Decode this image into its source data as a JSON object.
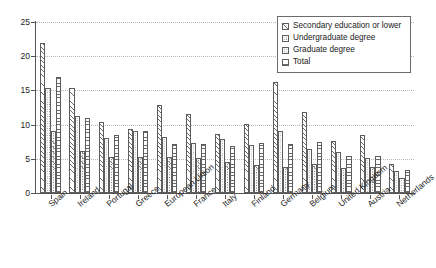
{
  "chart_data": {
    "type": "bar",
    "title": "",
    "subtitle": "",
    "xlabel": "",
    "ylabel": "",
    "ylim": [
      0,
      25
    ],
    "yticks": [
      0,
      5,
      10,
      15,
      20,
      25
    ],
    "grid": true,
    "legend_position": "upper-right",
    "categories": [
      "Spain",
      "Ireland",
      "Portugal",
      "Greece",
      "European Union",
      "France",
      "Italy",
      "Finland",
      "Germany",
      "Belgium",
      "United Kingdom",
      "Austria",
      "Netherlands"
    ],
    "series": [
      {
        "name": "Secondary education or lower",
        "pattern": "diagonal-hatch",
        "values": [
          22.0,
          15.3,
          10.4,
          9.3,
          12.9,
          11.6,
          8.6,
          10.1,
          16.3,
          11.8,
          7.6,
          8.5,
          4.3
        ]
      },
      {
        "name": "Undergraduate degree",
        "pattern": "dotted-hatch",
        "values": [
          15.3,
          11.3,
          8.0,
          9.0,
          8.2,
          7.3,
          7.9,
          7.0,
          9.0,
          6.5,
          6.0,
          5.1,
          3.2
        ]
      },
      {
        "name": "Graduate degree",
        "pattern": "fine-dot-hatch",
        "values": [
          9.1,
          6.2,
          5.3,
          5.3,
          5.3,
          5.1,
          4.6,
          4.1,
          3.8,
          4.2,
          3.7,
          3.8,
          2.2
        ]
      },
      {
        "name": "Total",
        "pattern": "horizontal-hatch",
        "values": [
          17.0,
          11.0,
          8.5,
          9.0,
          7.2,
          7.2,
          6.9,
          7.3,
          7.2,
          7.5,
          5.4,
          5.4,
          3.3
        ]
      }
    ]
  },
  "legend": {
    "items": [
      {
        "label": "Secondary education or lower"
      },
      {
        "label": "Undergraduate degree"
      },
      {
        "label": "Graduate degree"
      },
      {
        "label": "Total"
      }
    ]
  }
}
